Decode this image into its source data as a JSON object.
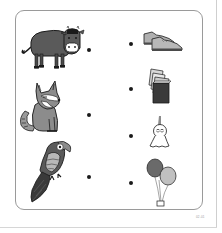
{
  "worksheet": {
    "type": "matching-exercise",
    "left_items": [
      {
        "name": "cow",
        "label": "cow"
      },
      {
        "name": "wolf",
        "label": "wolf"
      },
      {
        "name": "parrot",
        "label": "parrot"
      }
    ],
    "right_items": [
      {
        "name": "shoes",
        "label": "shoes"
      },
      {
        "name": "books",
        "label": "books"
      },
      {
        "name": "teru-teru-bozu-doll",
        "label": "teru teru bozu doll"
      },
      {
        "name": "balloons",
        "label": "balloons"
      }
    ],
    "page_number": "02-01"
  },
  "colors": {
    "ink": "#1a1a1a",
    "dark_gray": "#5a5a5a",
    "mid_gray": "#8c8c8c",
    "light_gray": "#b8b8b8",
    "border": "#9a9a9a"
  }
}
